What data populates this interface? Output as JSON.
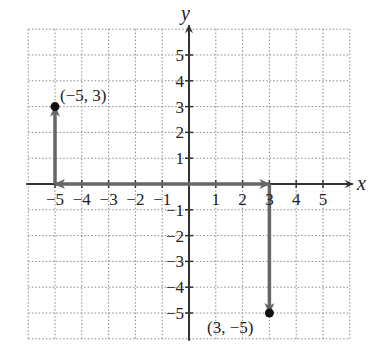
{
  "chart_data": {
    "type": "scatter",
    "title": "",
    "xlabel": "x",
    "ylabel": "y",
    "xlim": [
      -6,
      6
    ],
    "ylim": [
      -6,
      6
    ],
    "grid": true,
    "x_ticks": [
      -5,
      -4,
      -3,
      -2,
      -1,
      1,
      2,
      3,
      4,
      5
    ],
    "y_ticks": [
      -5,
      -4,
      -3,
      -2,
      -1,
      1,
      2,
      3,
      4,
      5
    ],
    "x_tick_labels": [
      "−5",
      "−4",
      "−3",
      "−2",
      "−1",
      "1",
      "2",
      "3",
      "4",
      "5"
    ],
    "y_tick_labels": [
      "−5",
      "−4",
      "−3",
      "−2",
      "−1",
      "1",
      "2",
      "3",
      "4",
      "5"
    ],
    "points": [
      {
        "x": -5,
        "y": 3,
        "label": "(−5, 3)"
      },
      {
        "x": 3,
        "y": -5,
        "label": "(3, −5)"
      }
    ],
    "arrows": [
      {
        "from": [
          0,
          0
        ],
        "to": [
          -5,
          0
        ],
        "note": "move left 5"
      },
      {
        "from": [
          -5,
          0
        ],
        "to": [
          -5,
          3
        ],
        "note": "move up 3"
      },
      {
        "from": [
          0,
          0
        ],
        "to": [
          3,
          0
        ],
        "note": "move right 3"
      },
      {
        "from": [
          3,
          0
        ],
        "to": [
          3,
          -5
        ],
        "note": "move down 5"
      }
    ]
  },
  "labels": {
    "x_axis": "x",
    "y_axis": "y",
    "point_a": "(−5, 3)",
    "point_b": "(3, −5)"
  }
}
